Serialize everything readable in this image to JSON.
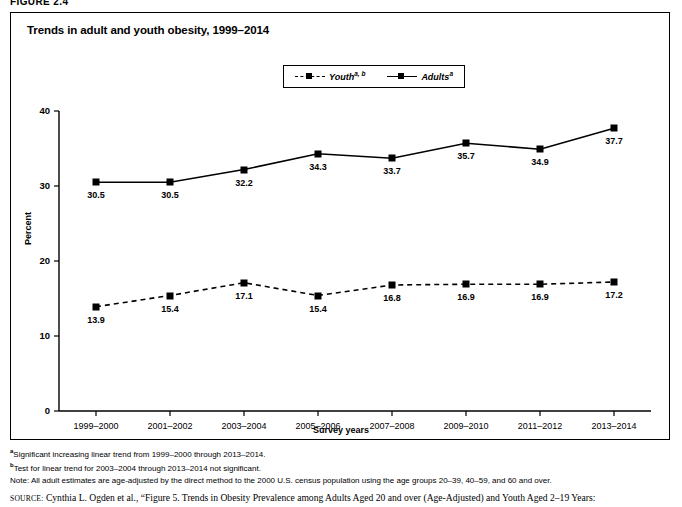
{
  "figure": {
    "label": "FIGURE 2.4"
  },
  "chart": {
    "title": "Trends in adult and youth obesity, 1999–2014"
  },
  "legend": [
    {
      "name": "Youth",
      "sup": "a, b",
      "style": "dashed",
      "marker": "square"
    },
    {
      "name": "Adults",
      "sup": "a",
      "style": "solid",
      "marker": "square"
    }
  ],
  "axes": {
    "ylabel": "Percent",
    "xlabel": "Survey years",
    "yticks": [
      "0",
      "10",
      "20",
      "30",
      "40"
    ],
    "ytick_values": [
      0,
      10,
      20,
      30,
      40
    ]
  },
  "footnotes": [
    {
      "sup": "a",
      "text": "Significant increasing linear trend from 1999–2000 through 2013–2014."
    },
    {
      "sup": "b",
      "text": "Test for linear trend for 2003–2004 through 2013–2014 not significant."
    },
    {
      "sup": "",
      "text": "Note: All adult estimates are age-adjusted by the direct method to the 2000 U.S. census population using the age groups 20–39, 40–59, and 60 and over."
    }
  ],
  "source": {
    "prefix": "SOURCE:",
    "text": " Cynthia L. Ogden et al., “Figure 5. Trends in Obesity Prevalence among Adults Aged 20 and over (Age-Adjusted) and Youth Aged 2–19 Years:"
  },
  "chart_data": {
    "type": "line",
    "title": "Trends in adult and youth obesity, 1999–2014",
    "xlabel": "Survey years",
    "ylabel": "Percent",
    "ylim": [
      0,
      40
    ],
    "grid": false,
    "legend_position": "top-center",
    "categories": [
      "1999–2000",
      "2001–2002",
      "2003–2004",
      "2005–2006",
      "2007–2008",
      "2009–2010",
      "2011–2012",
      "2013–2014"
    ],
    "series": [
      {
        "name": "Adults",
        "footnote": "a",
        "line_style": "solid",
        "marker": "square",
        "color": "#000000",
        "values": [
          30.5,
          30.5,
          32.2,
          34.3,
          33.7,
          35.7,
          34.9,
          37.7
        ]
      },
      {
        "name": "Youth",
        "footnote": "a, b",
        "line_style": "dashed",
        "marker": "square",
        "color": "#000000",
        "values": [
          13.9,
          15.4,
          17.1,
          15.4,
          16.8,
          16.9,
          16.9,
          17.2
        ]
      }
    ]
  }
}
